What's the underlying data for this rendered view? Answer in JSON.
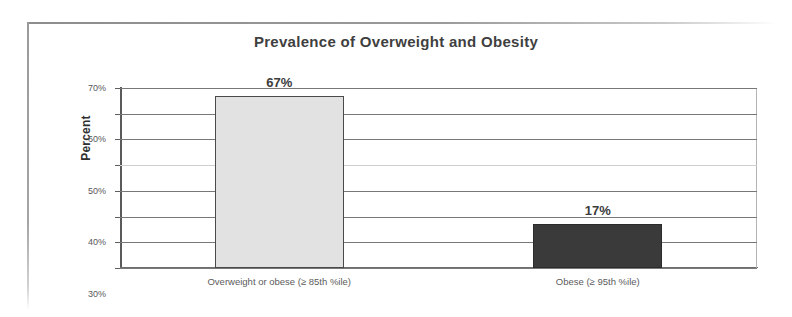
{
  "chart_data": {
    "type": "bar",
    "title": "Prevalence of Overweight and Obesity",
    "xlabel": "",
    "ylabel": "Percent",
    "categories": [
      "Overweight or obese (≥ 85th %ile)",
      "Obese (≥ 95th %ile)"
    ],
    "values": [
      67,
      17
    ],
    "value_labels": [
      "67%",
      "17%"
    ],
    "ylim": [
      0,
      70
    ],
    "ytick_values": [
      0,
      10,
      20,
      30,
      40,
      50,
      60,
      70
    ],
    "ytick_labels": [
      "0%",
      "10%",
      "20%",
      "30%",
      "40%",
      "50%",
      "60%",
      "70%"
    ],
    "grid": true,
    "legend": "none",
    "bar_colors": [
      "#e2e2e2",
      "#3a3a3a"
    ],
    "bar_border_colors": [
      "#4a4a4a",
      "#2b2b2b"
    ]
  },
  "colors": {
    "title": "#3f3f3f",
    "axis_text": "#58585a",
    "gridline": "#787878",
    "axis_line": "#5a5a5a",
    "frame": "#9a9a9a",
    "background": "#ffffff"
  }
}
